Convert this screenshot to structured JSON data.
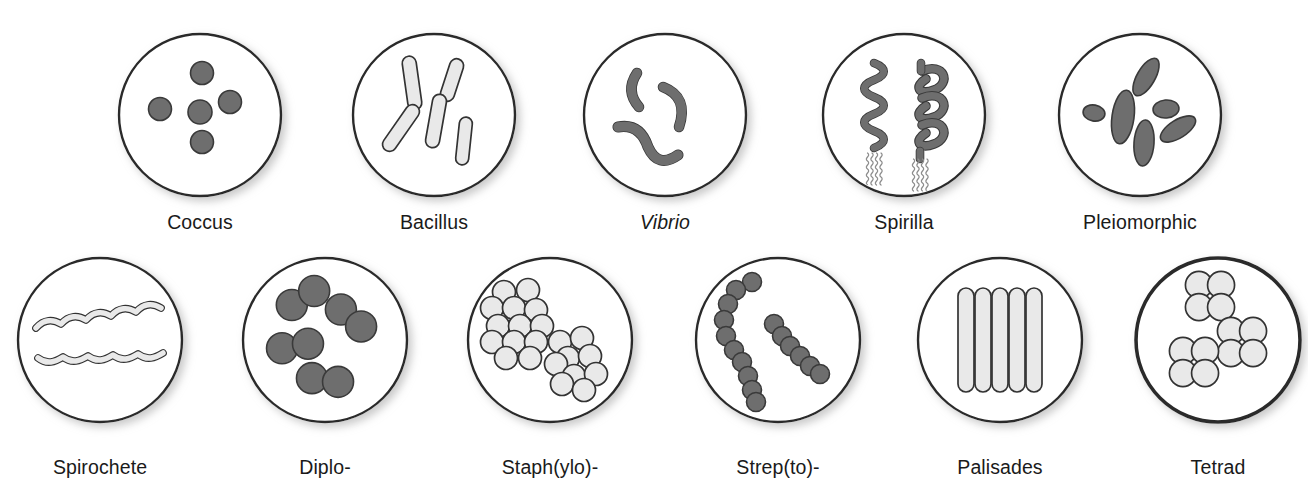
{
  "figure": {
    "background_color": "#ffffff",
    "outline_color": "#2b2b2b",
    "dark_cell_fill": "#6e6e6e",
    "dark_cell_stroke": "#3a3a3a",
    "light_cell_fill": "#e9e9e9",
    "light_cell_stroke": "#333333",
    "label_color": "#1a1a1a",
    "shadow_color": "#cfcfcf"
  },
  "rows": [
    {
      "name": "shapes-row",
      "panels": [
        {
          "id": "coccus",
          "label": "Coccus",
          "italic": false,
          "cx": 200,
          "cy": 115,
          "r": 81,
          "ring_width": 2.4,
          "label_x": 200,
          "label_y": 213,
          "cell_style": "dark",
          "morphology": "spherical cells, singly arranged",
          "cell_count": 5
        },
        {
          "id": "bacillus",
          "label": "Bacillus",
          "italic": false,
          "cx": 434,
          "cy": 115,
          "r": 81,
          "ring_width": 2.4,
          "label_x": 434,
          "label_y": 213,
          "cell_style": "light",
          "morphology": "rod-shaped cells, scattered",
          "cell_count": 6
        },
        {
          "id": "vibrio",
          "label": "Vibrio",
          "italic": true,
          "cx": 665,
          "cy": 115,
          "r": 81,
          "ring_width": 2.4,
          "label_x": 665,
          "label_y": 213,
          "cell_style": "dark",
          "morphology": "comma-shaped curved rods",
          "cell_count": 3
        },
        {
          "id": "spirilla",
          "label": "Spirilla",
          "italic": false,
          "cx": 904,
          "cy": 115,
          "r": 81,
          "ring_width": 2.4,
          "label_x": 904,
          "label_y": 213,
          "cell_style": "dark",
          "morphology": "rigid helical cells with polar flagella tufts",
          "cell_count": 2
        },
        {
          "id": "pleiomorphic",
          "label": "Pleiomorphic",
          "italic": false,
          "cx": 1140,
          "cy": 115,
          "r": 81,
          "ring_width": 2.4,
          "label_x": 1140,
          "label_y": 213,
          "cell_style": "dark",
          "morphology": "cells of variable size and shape",
          "cell_count": 6
        }
      ]
    },
    {
      "name": "arrangements-row",
      "panels": [
        {
          "id": "spirochete",
          "label": "Spirochete",
          "italic": false,
          "cx": 100,
          "cy": 340,
          "r": 82,
          "ring_width": 2.4,
          "label_x": 100,
          "label_y": 458,
          "cell_style": "light",
          "morphology": "flexible spiral filaments",
          "cell_count": 2
        },
        {
          "id": "diplo",
          "label": "Diplo-",
          "italic": false,
          "cx": 325,
          "cy": 340,
          "r": 82,
          "ring_width": 2.4,
          "label_x": 325,
          "label_y": 458,
          "cell_style": "dark",
          "morphology": "cells joined in pairs",
          "cell_count": 8
        },
        {
          "id": "staphylo",
          "label": "Staph(ylo)-",
          "italic": false,
          "cx": 550,
          "cy": 340,
          "r": 82,
          "ring_width": 2.4,
          "label_x": 550,
          "label_y": 458,
          "cell_style": "light",
          "morphology": "irregular grape-like clusters",
          "cell_count": 23
        },
        {
          "id": "strepto",
          "label": "Strep(to)-",
          "italic": false,
          "cx": 778,
          "cy": 340,
          "r": 82,
          "ring_width": 2.4,
          "label_x": 778,
          "label_y": 458,
          "cell_style": "dark",
          "morphology": "cells joined in chains",
          "cell_count": 20
        },
        {
          "id": "palisades",
          "label": "Palisades",
          "italic": false,
          "cx": 1000,
          "cy": 340,
          "r": 82,
          "ring_width": 2.4,
          "label_x": 1000,
          "label_y": 458,
          "cell_style": "light",
          "morphology": "rods aligned side by side like a fence",
          "cell_count": 5
        },
        {
          "id": "tetrad",
          "label": "Tetrad",
          "italic": false,
          "cx": 1218,
          "cy": 340,
          "r": 82,
          "ring_width": 3.6,
          "label_x": 1218,
          "label_y": 458,
          "cell_style": "light",
          "morphology": "groups of four cells in a square",
          "cell_count": 12
        }
      ]
    }
  ]
}
